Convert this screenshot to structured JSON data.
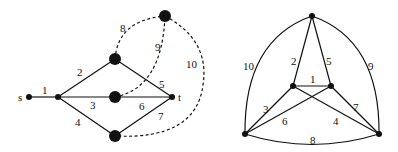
{
  "left_graph": {
    "node_labels": {
      "s": "s",
      "t": "t"
    },
    "edge_labels": [
      "1",
      "2",
      "3",
      "4",
      "5",
      "6",
      "7",
      "8",
      "9",
      "10"
    ]
  },
  "right_graph": {
    "edge_labels": [
      "1",
      "2",
      "3",
      "4",
      "5",
      "6",
      "7",
      "8",
      "9",
      "10"
    ]
  },
  "colors": {
    "stroke": "#111111",
    "background": "#ffffff"
  }
}
